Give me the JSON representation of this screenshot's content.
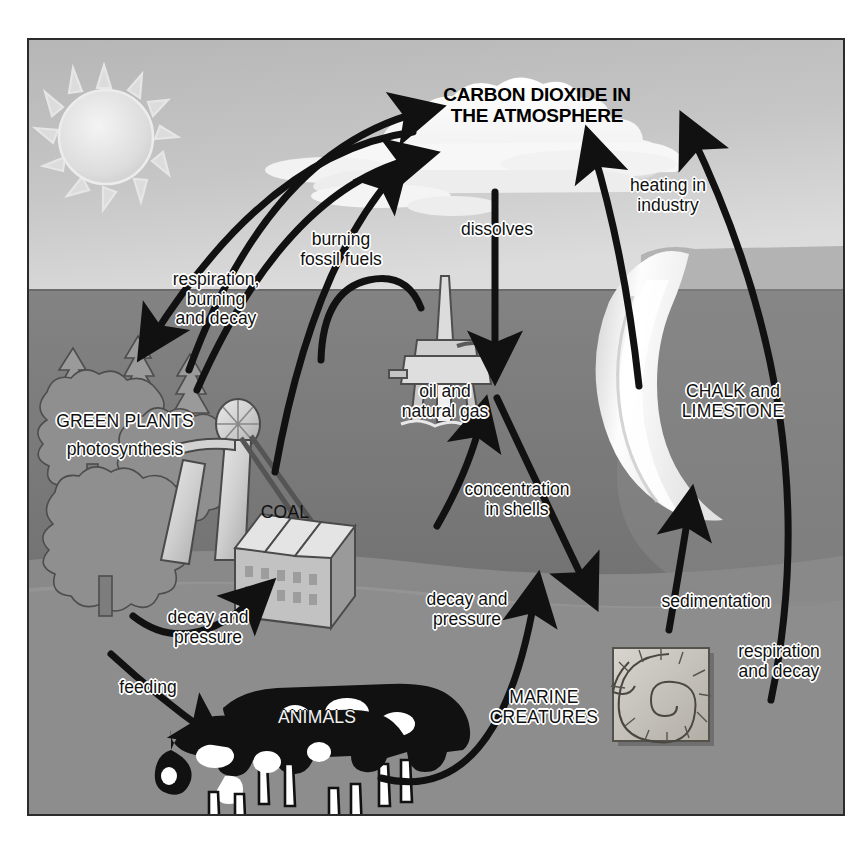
{
  "diagram": {
    "kind": "carbon-cycle",
    "title": "CARBON DIOXIDE IN\nTHE ATMOSPHERE",
    "frame_border_color": "#2b2b2b",
    "palette": {
      "paper": "#ffffff",
      "sky": "#c9c9c9",
      "sea": "#7e7e7e",
      "land": "#8d8d8d",
      "chalk": "#f2f2f2",
      "ink": "#111111",
      "label_halo": "#ffffff"
    }
  },
  "labels": {
    "atmosphere": "CARBON DIOXIDE IN\nTHE ATMOSPHERE",
    "respiration_burning_decay": "respiration,\nburning\nand decay",
    "burning_fossil_fuels": "burning\nfossil fuels",
    "dissolves": "dissolves",
    "heating_in_industry": "heating in\nindustry",
    "green_plants": "GREEN PLANTS",
    "photosynthesis": "photosynthesis",
    "oil_and_natural_gas": "oil and\nnatural gas",
    "chalk_and_limestone": "CHALK and\nLIMESTONE",
    "coal": "COAL",
    "concentration_in_shells": "concentration\nin shells",
    "decay_and_pressure_left": "decay and\npressure",
    "decay_and_pressure_mid": "decay and\npressure",
    "sedimentation": "sedimentation",
    "respiration_and_decay": "respiration\nand decay",
    "feeding": "feeding",
    "animals": "ANIMALS",
    "marine_creatures": "MARINE\nCREATURES"
  },
  "scene_objects": [
    {
      "name": "sun",
      "label": ""
    },
    {
      "name": "cloud",
      "label": ""
    },
    {
      "name": "forest-trees",
      "label": "GREEN PLANTS"
    },
    {
      "name": "pump-jack",
      "label": ""
    },
    {
      "name": "coal-factory",
      "label": "COAL"
    },
    {
      "name": "oil-rig",
      "label": "oil and natural gas"
    },
    {
      "name": "chalk-cliff",
      "label": "CHALK and LIMESTONE"
    },
    {
      "name": "ammonite-fossil",
      "label": "MARINE CREATURES"
    },
    {
      "name": "cows",
      "label": "ANIMALS"
    }
  ],
  "flows": [
    {
      "from": "green-plants",
      "to": "atmosphere",
      "label": "respiration, burning and decay",
      "direction": "both"
    },
    {
      "from": "coal",
      "to": "atmosphere",
      "label": "burning fossil fuels",
      "direction": "up"
    },
    {
      "from": "oil-and-natural-gas",
      "to": "atmosphere",
      "label": "burning fossil fuels",
      "direction": "up"
    },
    {
      "from": "atmosphere",
      "to": "sea",
      "label": "dissolves",
      "direction": "down"
    },
    {
      "from": "chalk-and-limestone",
      "to": "atmosphere",
      "label": "heating in industry",
      "direction": "up"
    },
    {
      "from": "marine-creatures",
      "to": "atmosphere",
      "label": "respiration and decay",
      "direction": "up"
    },
    {
      "from": "sea",
      "to": "marine-creatures",
      "label": "concentration in shells",
      "direction": "down"
    },
    {
      "from": "marine-creatures",
      "to": "chalk-and-limestone",
      "label": "sedimentation",
      "direction": "up"
    },
    {
      "from": "green-plants",
      "to": "coal",
      "label": "decay and pressure",
      "direction": "right"
    },
    {
      "from": "green-plants",
      "to": "animals",
      "label": "feeding",
      "direction": "right"
    },
    {
      "from": "animals",
      "to": "oil-and-natural-gas",
      "label": "decay and pressure",
      "direction": "right"
    }
  ]
}
